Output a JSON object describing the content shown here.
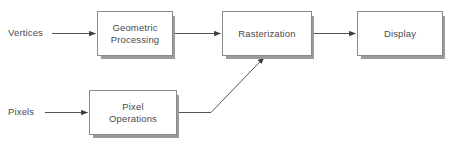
{
  "diagram": {
    "background_color": "#ffffff",
    "box_fill_color": "#ffffff",
    "box_border_color": "#8a8a8a",
    "box_shadow_color": "#999999",
    "text_color": "#4a4a4a",
    "connector_color": "#555555",
    "canvas": {
      "width": 450,
      "height": 147
    },
    "inputs": [
      {
        "id": "vertices",
        "label": "Vertices"
      },
      {
        "id": "pixels",
        "label": "Pixels"
      }
    ],
    "nodes": [
      {
        "id": "geometric-processing",
        "label": "Geometric\nProcessing",
        "x": 97,
        "y": 11,
        "width": 76,
        "height": 45
      },
      {
        "id": "rasterization",
        "label": "Rasterization",
        "x": 222,
        "y": 11,
        "width": 90,
        "height": 45
      },
      {
        "id": "display",
        "label": "Display",
        "x": 357,
        "y": 11,
        "width": 86,
        "height": 45
      },
      {
        "id": "pixel-operations",
        "label": "Pixel\nOperations",
        "x": 89,
        "y": 90,
        "width": 88,
        "height": 45
      }
    ],
    "edges": [
      {
        "id": "vertices-to-geometric",
        "from": "vertices",
        "to": "geometric-processing",
        "style": "straight"
      },
      {
        "id": "geometric-to-rasterization",
        "from": "geometric-processing",
        "to": "rasterization",
        "style": "straight"
      },
      {
        "id": "rasterization-to-display",
        "from": "rasterization",
        "to": "display",
        "style": "straight"
      },
      {
        "id": "pixels-to-pixelops",
        "from": "pixels",
        "to": "pixel-operations",
        "style": "straight"
      },
      {
        "id": "pixelops-to-rasterization",
        "from": "pixel-operations",
        "to": "rasterization",
        "style": "elbow-diagonal"
      }
    ]
  }
}
